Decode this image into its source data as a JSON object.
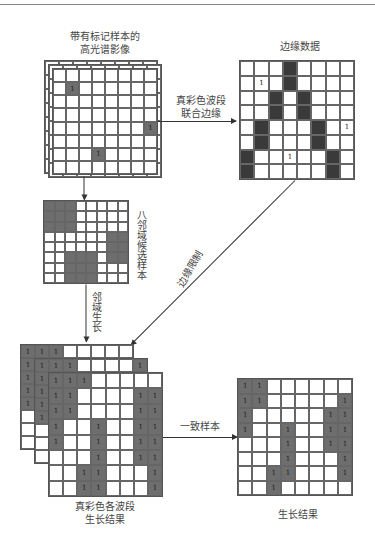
{
  "labels": {
    "hsi_title_1": "带有标记样本的",
    "hsi_title_2": "高光谱影像",
    "edge_title": "边缘数据",
    "arrow_edge_1": "真彩色波段",
    "arrow_edge_2": "联合边缘",
    "neighbor_label": "八邻域候选样本",
    "edge_constraint": "边缘限制",
    "region_growth": "邻域生长",
    "consistent_samples": "一致样本",
    "bands_result_1": "真彩色各波段",
    "bands_result_2": "生长结果",
    "final_result": "生长结果"
  },
  "colors": {
    "gray": "#6e6e6e",
    "dark": "#3a3a3a",
    "line": "#555555"
  },
  "grids": {
    "hsi": {
      "rows": 8,
      "cols": 8,
      "gray": [
        [
          1,
          1
        ],
        [
          4,
          7
        ],
        [
          6,
          3
        ]
      ]
    },
    "edge": {
      "rows": 8,
      "cols": 8,
      "dark": [
        [
          0,
          3
        ],
        [
          1,
          3
        ],
        [
          2,
          2
        ],
        [
          3,
          2
        ],
        [
          2,
          4
        ],
        [
          3,
          4
        ],
        [
          4,
          1
        ],
        [
          5,
          1
        ],
        [
          4,
          5
        ],
        [
          5,
          5
        ],
        [
          6,
          0
        ],
        [
          7,
          0
        ],
        [
          6,
          6
        ],
        [
          7,
          6
        ]
      ],
      "marks": [
        [
          1,
          1
        ],
        [
          4,
          7
        ],
        [
          6,
          3
        ]
      ]
    },
    "neighbor": {
      "rows": 8,
      "cols": 8,
      "gray": [
        [
          0,
          0
        ],
        [
          0,
          1
        ],
        [
          0,
          2
        ],
        [
          1,
          0
        ],
        [
          1,
          1
        ],
        [
          1,
          2
        ],
        [
          2,
          0
        ],
        [
          2,
          1
        ],
        [
          2,
          2
        ],
        [
          3,
          6
        ],
        [
          3,
          7
        ],
        [
          4,
          6
        ],
        [
          4,
          7
        ],
        [
          5,
          6
        ],
        [
          5,
          7
        ],
        [
          5,
          2
        ],
        [
          5,
          3
        ],
        [
          5,
          4
        ],
        [
          6,
          2
        ],
        [
          6,
          3
        ],
        [
          6,
          4
        ],
        [
          7,
          2
        ],
        [
          7,
          3
        ],
        [
          7,
          4
        ]
      ]
    },
    "bands_front": {
      "rows": 8,
      "cols": 8,
      "gray": [
        [
          0,
          0
        ],
        [
          0,
          1
        ],
        [
          0,
          2
        ],
        [
          1,
          0
        ],
        [
          1,
          1
        ],
        [
          1,
          6
        ],
        [
          1,
          7
        ],
        [
          2,
          0
        ],
        [
          2,
          1
        ],
        [
          2,
          6
        ],
        [
          2,
          7
        ],
        [
          3,
          0
        ],
        [
          3,
          3
        ],
        [
          3,
          6
        ],
        [
          3,
          7
        ],
        [
          4,
          0
        ],
        [
          4,
          3
        ],
        [
          4,
          6
        ],
        [
          4,
          7
        ],
        [
          5,
          3
        ],
        [
          5,
          6
        ],
        [
          5,
          7
        ],
        [
          6,
          2
        ],
        [
          6,
          3
        ],
        [
          6,
          7
        ],
        [
          7,
          2
        ],
        [
          7,
          3
        ],
        [
          7,
          7
        ]
      ]
    },
    "bands_middle": {
      "rows": 8,
      "cols": 8,
      "gray": [
        [
          0,
          0
        ],
        [
          0,
          1
        ],
        [
          0,
          2
        ],
        [
          0,
          7
        ],
        [
          1,
          0
        ],
        [
          2,
          0
        ],
        [
          3,
          0
        ],
        [
          4,
          0
        ]
      ]
    },
    "bands_back": {
      "rows": 8,
      "cols": 8,
      "gray": [
        [
          0,
          0
        ],
        [
          0,
          1
        ],
        [
          0,
          2
        ],
        [
          1,
          0
        ],
        [
          1,
          6
        ],
        [
          1,
          7
        ],
        [
          2,
          0
        ],
        [
          3,
          0
        ],
        [
          4,
          0
        ]
      ]
    },
    "result": {
      "rows": 8,
      "cols": 8,
      "gray": [
        [
          0,
          0
        ],
        [
          0,
          1
        ],
        [
          1,
          0
        ],
        [
          1,
          1
        ],
        [
          1,
          7
        ],
        [
          2,
          0
        ],
        [
          2,
          6
        ],
        [
          2,
          7
        ],
        [
          3,
          0
        ],
        [
          3,
          3
        ],
        [
          3,
          6
        ],
        [
          3,
          7
        ],
        [
          4,
          3
        ],
        [
          4,
          6
        ],
        [
          4,
          7
        ],
        [
          5,
          3
        ],
        [
          5,
          7
        ],
        [
          6,
          2
        ],
        [
          6,
          3
        ],
        [
          6,
          7
        ],
        [
          7,
          2
        ]
      ]
    }
  }
}
